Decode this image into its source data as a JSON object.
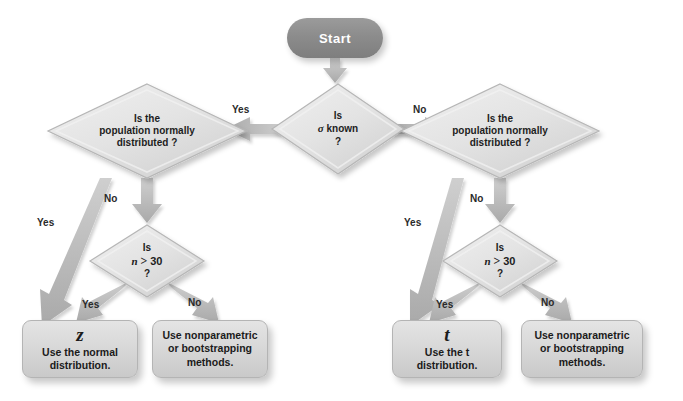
{
  "diagram": {
    "background_color": "#ffffff",
    "node_fill": "#dcdcdc",
    "start_fill": "#8c8c8c",
    "arrow_fill": "#b9b9b9"
  },
  "start": {
    "label": "Start"
  },
  "decisions": {
    "sigma_known": {
      "line1": "Is",
      "line2_symbol": "σ",
      "line2_text": " known",
      "line3": "?"
    },
    "normal_left": {
      "line1": "Is the",
      "line2": "population normally",
      "line3": "distributed ?"
    },
    "normal_right": {
      "line1": "Is the",
      "line2": "population normally",
      "line3": "distributed ?"
    },
    "n30_left": {
      "line1": "Is",
      "symbol": "n",
      "operator": ">",
      "value": "30",
      "line3": "?"
    },
    "n30_right": {
      "line1": "Is",
      "symbol": "n",
      "operator": ">",
      "value": "30",
      "line3": "?"
    }
  },
  "results": {
    "z_box": {
      "symbol": "z",
      "line1": "Use the normal",
      "line2": "distribution."
    },
    "nonparametric_left": {
      "line1": "Use nonparametric",
      "line2": "or bootstrapping",
      "line3": "methods."
    },
    "t_box": {
      "symbol": "t",
      "line1": "Use the t",
      "line2": "distribution."
    },
    "nonparametric_right": {
      "line1": "Use nonparametric",
      "line2": "or bootstrapping",
      "line3": "methods."
    }
  },
  "edge_labels": {
    "sigma_yes": "Yes",
    "sigma_no": "No",
    "left_normal_yes": "Yes",
    "left_normal_no": "No",
    "left_n30_yes": "Yes",
    "left_n30_no": "No",
    "right_normal_yes": "Yes",
    "right_normal_no": "No",
    "right_n30_yes": "Yes",
    "right_n30_no": "No"
  }
}
